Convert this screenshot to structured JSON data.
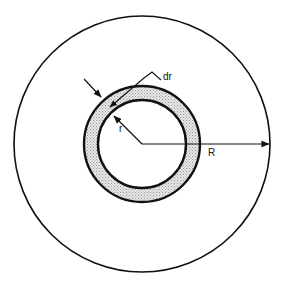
{
  "diagram": {
    "labels": {
      "dr": "dr",
      "r": "r",
      "R": "R"
    },
    "colors": {
      "stroke": "#111111",
      "ring_fill": "#d9d9d9",
      "background": "#ffffff"
    }
  }
}
